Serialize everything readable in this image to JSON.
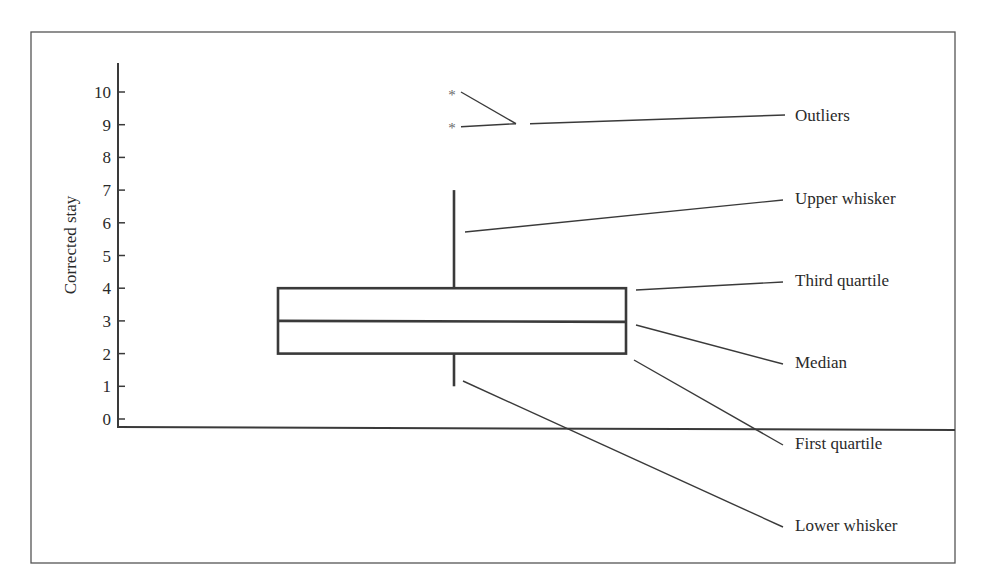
{
  "chart_data": {
    "type": "box",
    "title": "",
    "xlabel": "",
    "ylabel": "Corrected stay",
    "ylim": [
      0,
      10
    ],
    "yticks": [
      0,
      1,
      2,
      3,
      4,
      5,
      6,
      7,
      8,
      9,
      10
    ],
    "grid": false,
    "legend": "none",
    "box": {
      "lower_whisker": 1,
      "first_quartile": 2,
      "median": 3,
      "third_quartile": 4,
      "upper_whisker": 7,
      "outliers": [
        9,
        10
      ]
    },
    "outlier_marker": "*",
    "annotations": [
      {
        "label": "Outliers",
        "points_to": "outliers"
      },
      {
        "label": "Upper whisker",
        "points_to": "upper_whisker"
      },
      {
        "label": "Third quartile",
        "points_to": "third_quartile"
      },
      {
        "label": "Median",
        "points_to": "median"
      },
      {
        "label": "First quartile",
        "points_to": "first_quartile"
      },
      {
        "label": "Lower whisker",
        "points_to": "lower_whisker"
      }
    ]
  },
  "colors": {
    "ink": "#3a3a3a",
    "frame": "#555555",
    "outlier_marker": "#6a6a6a",
    "background": "#ffffff"
  }
}
